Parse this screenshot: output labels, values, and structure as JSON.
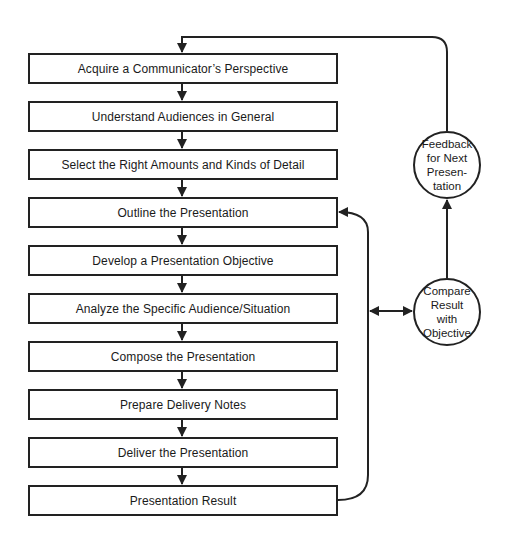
{
  "diagram": {
    "steps": [
      {
        "label": "Acquire a Communicator’s Perspective",
        "top": 53
      },
      {
        "label": "Understand Audiences in General",
        "top": 101
      },
      {
        "label": "Select the Right Amounts and Kinds of Detail",
        "top": 149
      },
      {
        "label": "Outline the Presentation",
        "top": 197
      },
      {
        "label": "Develop a Presentation Objective",
        "top": 245
      },
      {
        "label": "Analyze the Specific Audience/Situation",
        "top": 293
      },
      {
        "label": "Compose the Presentation",
        "top": 341
      },
      {
        "label": "Prepare Delivery Notes",
        "top": 389
      },
      {
        "label": "Deliver the Presentation",
        "top": 437
      },
      {
        "label": "Presentation Result",
        "top": 485
      }
    ],
    "feedback_node": {
      "lines": [
        "Feedback",
        "for Next",
        "Presen-",
        "tation"
      ]
    },
    "compare_node": {
      "lines": [
        "Compare",
        "Result",
        "with",
        "Objective"
      ]
    },
    "colors": {
      "stroke": "#222222",
      "background": "#ffffff"
    }
  }
}
